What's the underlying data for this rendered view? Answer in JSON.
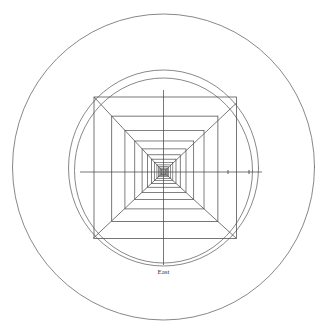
{
  "figure": {
    "title": "",
    "background_color": "#ffffff",
    "stroke_color": "#5a5a5a",
    "stroke_color_dark": "#3c3c3c",
    "width": 328,
    "height": 333
  },
  "labels": {
    "east": "East"
  },
  "chart_data": {
    "type": "scatter",
    "title": "",
    "xlabel": "East",
    "ylabel": "",
    "grid": false,
    "legend": "none",
    "center": {
      "x": 163.5,
      "y": 172.0
    },
    "circles": [
      {
        "name": "outer-boundary-circle",
        "cx": 163.5,
        "cy": 167.0,
        "rx": 151.0,
        "ry": 153.0,
        "stroke": "#6a6a6a",
        "width": 0.8
      },
      {
        "name": "mid-circle-outer",
        "cx": 163.5,
        "cy": 168.0,
        "rx": 95.0,
        "ry": 98.0,
        "stroke": "#6a6a6a",
        "width": 0.8
      },
      {
        "name": "mid-circle-inner",
        "cx": 163.5,
        "cy": 170.5,
        "rx": 89.0,
        "ry": 92.5,
        "stroke": "#6a6a6a",
        "width": 0.8
      }
    ],
    "squares": {
      "description": "Concentric nested rectangles converging on center, geometric progression",
      "outer": {
        "left": 94.0,
        "top": 97.0,
        "right": 236.5,
        "bottom": 238.5
      },
      "count": 13,
      "ratio": 0.745,
      "stroke": "#4a4a4a"
    },
    "diagonals": [
      {
        "name": "diagonal-top-left",
        "x1": 94.0,
        "y1": 97.0,
        "x2": 163.5,
        "y2": 172.0
      },
      {
        "name": "diagonal-top-right",
        "x1": 236.5,
        "y1": 103.0,
        "x2": 163.5,
        "y2": 172.0
      },
      {
        "name": "diagonal-bottom-left",
        "x1": 93.0,
        "y1": 238.5,
        "x2": 163.5,
        "y2": 172.0
      },
      {
        "name": "diagonal-bottom-right",
        "x1": 236.5,
        "y1": 238.5,
        "x2": 163.5,
        "y2": 172.0
      }
    ],
    "axes": [
      {
        "name": "horizontal-axis",
        "x1": 80.0,
        "y1": 172.0,
        "x2": 262.0,
        "y2": 172.0
      },
      {
        "name": "vertical-axis",
        "x1": 163.5,
        "y1": 90.0,
        "x2": 163.5,
        "y2": 265.0
      }
    ],
    "ticks": [
      {
        "name": "tick-east-1",
        "x": 228.0,
        "y": 172.0,
        "size": 4
      },
      {
        "name": "tick-east-2",
        "x": 249.0,
        "y": 172.0,
        "size": 4
      }
    ],
    "annotations": [
      {
        "name": "east-label",
        "text": "East",
        "x": 163.5,
        "y": 272.0
      }
    ]
  }
}
